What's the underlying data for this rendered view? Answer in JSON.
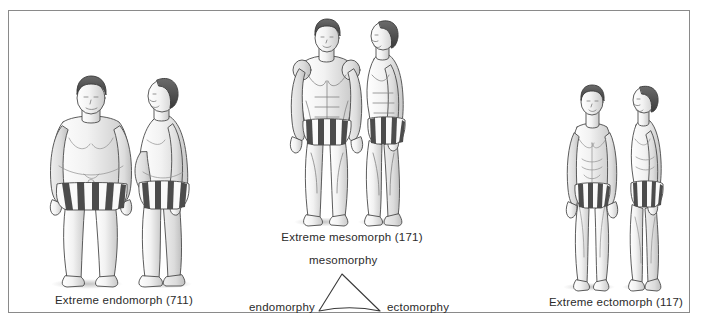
{
  "figure": {
    "border_color": "#8a8a8a",
    "background": "#ffffff",
    "text_color": "#2b2b2b"
  },
  "somatotypes": [
    {
      "id": "endomorph",
      "caption": "Extreme endomorph (711)",
      "views": [
        "front",
        "side"
      ]
    },
    {
      "id": "mesomorph",
      "caption": "Extreme mesomorph (171)",
      "views": [
        "front",
        "side"
      ]
    },
    {
      "id": "ectomorph",
      "caption": "Extreme ectomorph (117)",
      "views": [
        "front",
        "side"
      ]
    }
  ],
  "triangle": {
    "apex_label": "mesomorphy",
    "left_label": "endomorphy",
    "right_label": "ectomorphy",
    "stroke_color": "#3a3a3a"
  }
}
